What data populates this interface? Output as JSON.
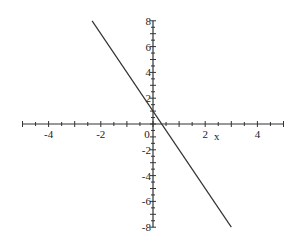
{
  "chart_data": {
    "type": "line",
    "title": "",
    "xlabel": "x",
    "ylabel": "",
    "xlim": [
      -5,
      5
    ],
    "ylim": [
      -8,
      8
    ],
    "grid": false,
    "legend": null,
    "x_ticks": [
      -4,
      -2,
      0,
      2,
      4
    ],
    "y_ticks": [
      -8,
      -6,
      -4,
      -2,
      2,
      4,
      6,
      8
    ],
    "x_tick_labels": [
      "-4",
      "-2",
      "0",
      "2",
      "4"
    ],
    "y_tick_labels": [
      "-8",
      "-6",
      "-4",
      "-2",
      "2",
      "4",
      "6",
      "8"
    ],
    "x_minor_step": 0.5,
    "y_minor_step": 0.5,
    "series": [
      {
        "name": "y = -3x + 1",
        "x": [
          -2.333,
          3
        ],
        "y": [
          8,
          -8
        ],
        "color": "#333333"
      }
    ]
  },
  "colors": {
    "axis": "#333333",
    "line": "#333333",
    "background": "#ffffff"
  }
}
